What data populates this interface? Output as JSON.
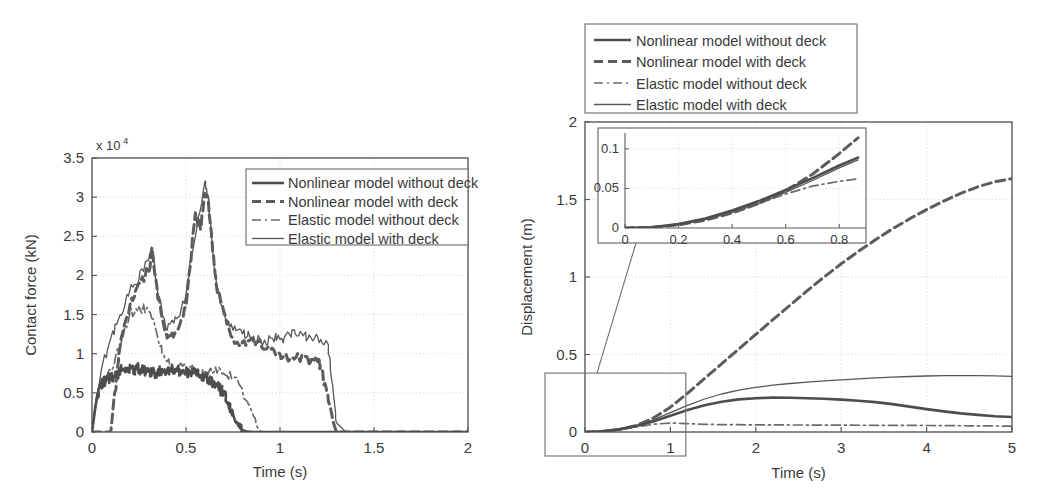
{
  "figure": {
    "panels": [
      "contact-force-panel",
      "displacement-panel"
    ]
  },
  "legend": {
    "entries": [
      {
        "label": "Nonlinear model without deck",
        "style": "solid-thick",
        "color": "#4a4a4a"
      },
      {
        "label": "Nonlinear model with deck",
        "style": "dashed-thick",
        "color": "#5a5a5a"
      },
      {
        "label": "Elastic model without deck",
        "style": "dash-dot",
        "color": "#6a6a6a"
      },
      {
        "label": "Elastic model with deck",
        "style": "solid-thin",
        "color": "#5a5a5a"
      }
    ]
  },
  "left_panel": {
    "y_multiplier": "x 10",
    "y_exponent": "4"
  },
  "chart_data": [
    {
      "type": "line",
      "name": "contact-force-chart",
      "title": "",
      "xlabel": "Time (s)",
      "ylabel": "Contact force (kN)",
      "xlim": [
        0,
        2
      ],
      "ylim": [
        0,
        35000
      ],
      "y_scale_factor": 10000,
      "xticks": [
        0,
        0.5,
        1,
        1.5,
        2
      ],
      "xticklabels": [
        "0",
        "0.5",
        "1",
        "1.5",
        "2"
      ],
      "yticks": [
        0,
        5000,
        10000,
        15000,
        20000,
        25000,
        30000,
        35000
      ],
      "yticklabels": [
        "0",
        "0.5",
        "1",
        "1.5",
        "2",
        "2.5",
        "3",
        "3.5"
      ],
      "grid": true,
      "legend_position": "top-right",
      "series": [
        {
          "name": "Nonlinear model without deck",
          "style": "solid-thick",
          "x": [
            0,
            0.02,
            0.04,
            0.06,
            0.08,
            0.1,
            0.12,
            0.14,
            0.16,
            0.18,
            0.2,
            0.22,
            0.24,
            0.26,
            0.28,
            0.3,
            0.32,
            0.34,
            0.36,
            0.38,
            0.4,
            0.42,
            0.44,
            0.46,
            0.48,
            0.5,
            0.52,
            0.54,
            0.56,
            0.58,
            0.6,
            0.62,
            0.64,
            0.66,
            0.68,
            0.7,
            0.72,
            0.74,
            0.76,
            0.78,
            0.8,
            0.82,
            0.84,
            0.86,
            0.88,
            0.9,
            0.92,
            1.0,
            1.2,
            1.5,
            2.0
          ],
          "y": [
            0,
            3500,
            5800,
            6200,
            6800,
            7000,
            7200,
            7600,
            8000,
            8200,
            8000,
            7900,
            8200,
            8000,
            7800,
            7700,
            7600,
            7500,
            7800,
            7900,
            8000,
            8100,
            8000,
            7900,
            7800,
            7700,
            7600,
            7500,
            7400,
            7200,
            7000,
            6800,
            6500,
            6100,
            5600,
            4800,
            3800,
            2600,
            1500,
            700,
            250,
            80,
            20,
            0,
            0,
            0,
            0,
            0,
            0,
            0,
            0
          ]
        },
        {
          "name": "Nonlinear model with deck",
          "style": "dashed-thick",
          "x": [
            0,
            0.05,
            0.1,
            0.12,
            0.15,
            0.2,
            0.25,
            0.3,
            0.32,
            0.35,
            0.4,
            0.45,
            0.5,
            0.55,
            0.58,
            0.6,
            0.62,
            0.64,
            0.66,
            0.7,
            0.75,
            0.8,
            0.85,
            0.9,
            0.95,
            1.0,
            1.05,
            1.1,
            1.15,
            1.2,
            1.22,
            1.25,
            1.28,
            1.3,
            1.5,
            2.0
          ],
          "y": [
            0,
            0,
            0,
            5000,
            11000,
            16000,
            19000,
            20500,
            23500,
            17000,
            12000,
            13000,
            16000,
            28000,
            26000,
            30500,
            29000,
            24000,
            19000,
            15500,
            12000,
            11500,
            12000,
            11000,
            10500,
            10000,
            9200,
            9500,
            9200,
            9000,
            8000,
            5000,
            1500,
            0,
            0,
            0
          ]
        },
        {
          "name": "Elastic model without deck",
          "style": "dash-dot",
          "x": [
            0,
            0.02,
            0.05,
            0.08,
            0.1,
            0.15,
            0.2,
            0.25,
            0.3,
            0.35,
            0.4,
            0.45,
            0.5,
            0.55,
            0.6,
            0.65,
            0.7,
            0.75,
            0.8,
            0.85,
            0.88,
            0.9,
            0.95,
            1.0,
            1.5,
            2.0
          ],
          "y": [
            0,
            4000,
            6000,
            7000,
            8000,
            11000,
            15000,
            16000,
            15500,
            12000,
            9000,
            8200,
            8000,
            7900,
            7800,
            7700,
            7500,
            7000,
            5500,
            2500,
            600,
            0,
            0,
            0,
            0,
            0
          ]
        },
        {
          "name": "Elastic model with deck",
          "style": "solid-thin",
          "x": [
            0,
            0.05,
            0.1,
            0.15,
            0.2,
            0.25,
            0.3,
            0.32,
            0.35,
            0.4,
            0.45,
            0.5,
            0.55,
            0.6,
            0.62,
            0.65,
            0.7,
            0.75,
            0.8,
            0.85,
            0.9,
            0.95,
            1.0,
            1.05,
            1.1,
            1.15,
            1.2,
            1.25,
            1.28,
            1.3,
            1.35,
            1.5,
            2.0
          ],
          "y": [
            0,
            8000,
            12000,
            15000,
            18000,
            19500,
            22000,
            23500,
            17500,
            13000,
            14500,
            17500,
            25000,
            32000,
            30000,
            21000,
            15000,
            13000,
            12500,
            12000,
            11500,
            12000,
            11800,
            12500,
            12300,
            12000,
            12200,
            11500,
            6000,
            1200,
            0,
            0,
            0
          ]
        }
      ]
    },
    {
      "type": "line",
      "name": "displacement-chart",
      "title": "",
      "xlabel": "Time (s)",
      "ylabel": "Displacement (m)",
      "xlim": [
        0,
        5
      ],
      "ylim": [
        0,
        2
      ],
      "xticks": [
        0,
        1,
        2,
        3,
        4,
        5
      ],
      "xticklabels": [
        "0",
        "1",
        "2",
        "3",
        "4",
        "5"
      ],
      "yticks": [
        0,
        0.5,
        1,
        1.5,
        2
      ],
      "yticklabels": [
        "0",
        "0.5",
        "1",
        "1.5",
        "2"
      ],
      "grid": true,
      "legend_position": "above-top-left",
      "series": [
        {
          "name": "Nonlinear model without deck",
          "style": "solid-thick",
          "x": [
            0,
            0.2,
            0.4,
            0.6,
            0.8,
            1.0,
            1.2,
            1.4,
            1.6,
            1.8,
            2.0,
            2.2,
            2.4,
            2.6,
            2.8,
            3.0,
            3.2,
            3.4,
            3.6,
            3.8,
            4.0,
            4.2,
            4.4,
            4.6,
            4.8,
            5.0
          ],
          "y": [
            0,
            0.004,
            0.017,
            0.038,
            0.068,
            0.105,
            0.142,
            0.172,
            0.195,
            0.21,
            0.218,
            0.222,
            0.221,
            0.218,
            0.214,
            0.209,
            0.202,
            0.193,
            0.18,
            0.164,
            0.148,
            0.133,
            0.12,
            0.11,
            0.102,
            0.097
          ]
        },
        {
          "name": "Nonlinear model with deck",
          "style": "dashed-thick",
          "x": [
            0,
            0.2,
            0.4,
            0.6,
            0.8,
            1.0,
            1.2,
            1.4,
            1.6,
            1.8,
            2.0,
            2.2,
            2.4,
            2.6,
            2.8,
            3.0,
            3.2,
            3.4,
            3.6,
            3.8,
            4.0,
            4.2,
            4.4,
            4.6,
            4.8,
            5.0
          ],
          "y": [
            0,
            0.003,
            0.016,
            0.042,
            0.09,
            0.16,
            0.25,
            0.345,
            0.44,
            0.535,
            0.63,
            0.725,
            0.818,
            0.91,
            1.0,
            1.085,
            1.165,
            1.24,
            1.31,
            1.375,
            1.435,
            1.49,
            1.54,
            1.582,
            1.615,
            1.635
          ]
        },
        {
          "name": "Elastic model without deck",
          "style": "dash-dot",
          "x": [
            0,
            0.2,
            0.4,
            0.6,
            0.8,
            1.0,
            1.2,
            1.4,
            1.6,
            1.8,
            2.0,
            2.5,
            3.0,
            3.5,
            4.0,
            4.5,
            5.0
          ],
          "y": [
            0,
            0.003,
            0.014,
            0.032,
            0.05,
            0.058,
            0.054,
            0.05,
            0.048,
            0.047,
            0.046,
            0.045,
            0.044,
            0.043,
            0.042,
            0.04,
            0.038
          ]
        },
        {
          "name": "Elastic model with deck",
          "style": "solid-thin",
          "x": [
            0,
            0.2,
            0.4,
            0.6,
            0.8,
            1.0,
            1.2,
            1.4,
            1.6,
            1.8,
            2.0,
            2.2,
            2.4,
            2.6,
            2.8,
            3.0,
            3.2,
            3.4,
            3.6,
            3.8,
            4.0,
            4.2,
            4.4,
            4.6,
            4.8,
            5.0
          ],
          "y": [
            0,
            0.004,
            0.016,
            0.04,
            0.078,
            0.125,
            0.172,
            0.213,
            0.245,
            0.27,
            0.288,
            0.302,
            0.313,
            0.322,
            0.33,
            0.337,
            0.343,
            0.349,
            0.354,
            0.358,
            0.361,
            0.363,
            0.364,
            0.364,
            0.362,
            0.359
          ]
        }
      ],
      "inset": {
        "name": "displacement-inset",
        "xlim": [
          0,
          0.87
        ],
        "ylim": [
          0,
          0.115
        ],
        "xticks": [
          0,
          0.2,
          0.4,
          0.6,
          0.8
        ],
        "xticklabels": [
          "0",
          "0.2",
          "0.4",
          "0.6",
          "0.8"
        ],
        "yticks": [
          0,
          0.05,
          0.1
        ],
        "yticklabels": [
          "0",
          "0.05",
          "0.1"
        ],
        "grid": true,
        "series": [
          {
            "name": "Nonlinear model without deck",
            "style": "solid-thick",
            "x": [
              0,
              0.1,
              0.2,
              0.3,
              0.4,
              0.5,
              0.6,
              0.7,
              0.8,
              0.87
            ],
            "y": [
              0,
              0.001,
              0.005,
              0.012,
              0.022,
              0.034,
              0.048,
              0.063,
              0.079,
              0.089
            ]
          },
          {
            "name": "Nonlinear model with deck",
            "style": "dashed-thick",
            "x": [
              0,
              0.1,
              0.2,
              0.3,
              0.4,
              0.5,
              0.6,
              0.7,
              0.8,
              0.87
            ],
            "y": [
              0,
              0.0008,
              0.004,
              0.01,
              0.019,
              0.031,
              0.047,
              0.068,
              0.094,
              0.114
            ]
          },
          {
            "name": "Elastic model without deck",
            "style": "dash-dot",
            "x": [
              0,
              0.1,
              0.2,
              0.3,
              0.4,
              0.5,
              0.6,
              0.7,
              0.8,
              0.87
            ],
            "y": [
              0,
              0.001,
              0.004,
              0.011,
              0.02,
              0.031,
              0.043,
              0.053,
              0.059,
              0.062
            ]
          },
          {
            "name": "Elastic model with deck",
            "style": "solid-thin",
            "x": [
              0,
              0.1,
              0.2,
              0.3,
              0.4,
              0.5,
              0.6,
              0.7,
              0.8,
              0.87
            ],
            "y": [
              0,
              0.001,
              0.004,
              0.011,
              0.02,
              0.031,
              0.045,
              0.06,
              0.076,
              0.086
            ]
          }
        ]
      },
      "zoom_box": {
        "x0": 0,
        "x1": 1.18,
        "y0": 0,
        "y1": 0.38
      }
    }
  ]
}
